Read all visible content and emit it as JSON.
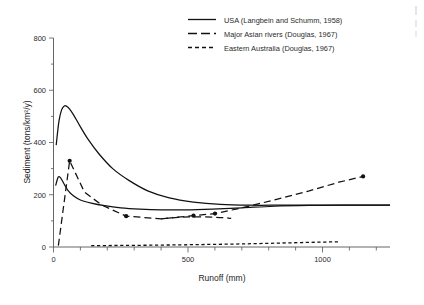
{
  "chart_data": {
    "type": "line",
    "title": "",
    "xlabel": "Runoff (mm)",
    "ylabel": "Sediment (tons/km2/y)",
    "ylabel_display": "Sediment (tons/km²/y)",
    "xlim": [
      0,
      1250
    ],
    "ylim": [
      0,
      800
    ],
    "xticks": [
      0,
      500,
      1000
    ],
    "xtick_labels": [
      "0",
      "500",
      "1000"
    ],
    "xticks_minor": [
      100,
      200,
      300,
      400,
      600,
      700,
      800,
      900,
      1100,
      1200
    ],
    "yticks": [
      0,
      200,
      400,
      600,
      800
    ],
    "ytick_labels": [
      "0",
      "200",
      "400",
      "600",
      "800"
    ],
    "grid": false,
    "legend_position": "top-center",
    "series": [
      {
        "name": "USA (Langbein and Schumm, 1958)",
        "style": "solid",
        "markers": false,
        "x": [
          10,
          20,
          30,
          40,
          50,
          60,
          75,
          100,
          130,
          170,
          220,
          280,
          350,
          430,
          520,
          620,
          730,
          850,
          980,
          1100,
          1250
        ],
        "y": [
          390,
          480,
          525,
          540,
          538,
          528,
          505,
          460,
          410,
          355,
          300,
          255,
          215,
          188,
          172,
          163,
          160,
          160,
          160,
          160,
          160
        ]
      },
      {
        "name": "USA lower branch",
        "style": "solid",
        "markers": false,
        "x": [
          8,
          18,
          28,
          40,
          55,
          75,
          100,
          140,
          190,
          250,
          320,
          400,
          490,
          590,
          700,
          820,
          950,
          1080,
          1250
        ],
        "y": [
          235,
          268,
          262,
          240,
          215,
          195,
          180,
          168,
          158,
          150,
          145,
          142,
          142,
          145,
          150,
          156,
          159,
          160,
          160
        ]
      },
      {
        "name": "Major Asian rivers (Douglas, 1967)",
        "style": "dashed",
        "markers": true,
        "x": [
          18,
          60,
          115,
          180,
          270,
          400,
          520,
          600,
          700,
          820,
          950,
          1060,
          1150
        ],
        "y": [
          5,
          330,
          210,
          160,
          118,
          108,
          120,
          128,
          150,
          180,
          215,
          248,
          270
        ],
        "marker_points": [
          {
            "x": 60,
            "y": 330
          },
          {
            "x": 270,
            "y": 118
          },
          {
            "x": 520,
            "y": 120
          },
          {
            "x": 600,
            "y": 128
          },
          {
            "x": 1150,
            "y": 270
          }
        ]
      },
      {
        "name": "Asian rivers lower tail",
        "style": "dashed",
        "markers": false,
        "x": [
          400,
          500,
          600,
          660
        ],
        "y": [
          108,
          115,
          114,
          110
        ]
      },
      {
        "name": "Eastern Australia (Douglas, 1967)",
        "style": "dotted",
        "markers": false,
        "x": [
          140,
          250,
          380,
          520,
          660,
          800,
          920,
          1010,
          1060
        ],
        "y": [
          5,
          6,
          7,
          9,
          11,
          14,
          17,
          19,
          20
        ]
      }
    ]
  },
  "legend": {
    "items": [
      {
        "label": "USA (Langbein and Schumm, 1958)",
        "style": "solid"
      },
      {
        "label": "Major Asian rivers (Douglas, 1967)",
        "style": "dashed"
      },
      {
        "label": "Eastern Australia (Douglas, 1967)",
        "style": "dotted"
      }
    ]
  },
  "colors": {
    "line": "#111111",
    "axis": "#555555",
    "text": "#2b2b2b",
    "background": "#ffffff"
  }
}
